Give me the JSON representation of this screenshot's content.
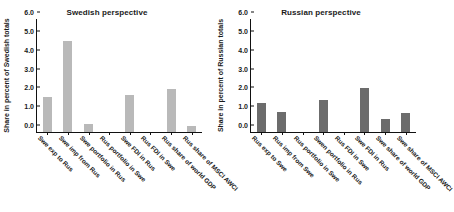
{
  "figure": {
    "background": "#ffffff",
    "panels": [
      "Swedish perspective",
      "Russian perspective"
    ]
  },
  "chart_data": [
    {
      "type": "bar",
      "title": "Swedish perspective",
      "xlabel": "",
      "ylabel": "Share in percent of Swedish totals",
      "ylim": [
        0.0,
        6.0
      ],
      "yticks": [
        "0.0",
        "1.0",
        "2.0",
        "3.0",
        "4.0",
        "5.0",
        "6.0"
      ],
      "ytick_values": [
        0.0,
        1.0,
        2.0,
        3.0,
        4.0,
        5.0,
        6.0
      ],
      "grid": false,
      "legend": "none",
      "bar_color": "#b9b9b9",
      "categories": [
        "Swe exp to Rus",
        "Swe imp from Rus",
        "Swe portfolio in Rus",
        "Rus portfolio in Swe",
        "Swe FDI in Rus",
        "Rus FDI in Swe",
        "Rus share of world GDP",
        "Rus share of MSCI AWCI"
      ],
      "values": [
        1.85,
        4.85,
        0.4,
        0.0,
        1.95,
        0.0,
        2.3,
        0.3
      ]
    },
    {
      "type": "bar",
      "title": "Russian perspective",
      "xlabel": "",
      "ylabel": "Share in percent of Russian totals",
      "ylim": [
        0.0,
        6.0
      ],
      "yticks": [
        "0.0",
        "1.0",
        "2.0",
        "3.0",
        "4.0",
        "5.0",
        "6.0"
      ],
      "ytick_values": [
        0.0,
        1.0,
        2.0,
        3.0,
        4.0,
        5.0,
        6.0
      ],
      "grid": false,
      "legend": "none",
      "bar_color": "#6c6c6c",
      "categories": [
        "Rus exp to Swe",
        "Rus imp from Swe",
        "Rus portfolio in Swe",
        "Swen portfolio in Rus",
        "Rus FDI in Swe",
        "Swe FDI in Rus",
        "Swe share of world GDP",
        "Swe share of MSCI AWCI"
      ],
      "values": [
        1.55,
        1.05,
        0.0,
        1.7,
        0.0,
        2.35,
        0.7,
        1.0
      ]
    }
  ]
}
